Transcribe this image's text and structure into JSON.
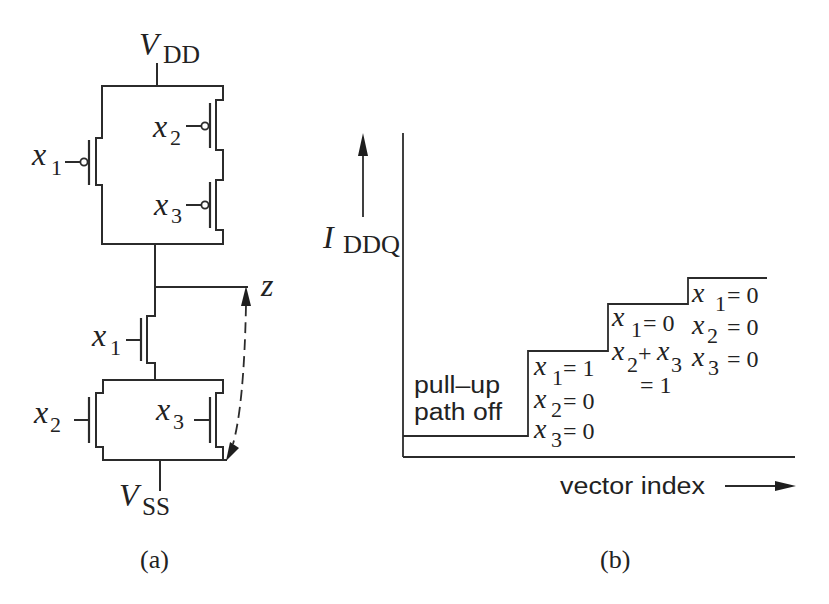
{
  "colors": {
    "background": "#ffffff",
    "line": "#2b2b2b",
    "text": "#222222"
  },
  "panel_a": {
    "caption": "(a)",
    "supply_top": {
      "symbol": "V",
      "subscript": "DD"
    },
    "supply_bottom": {
      "symbol": "V",
      "subscript": "SS"
    },
    "output_node": "z",
    "pull_up": [
      {
        "var": "x",
        "sub": "1"
      },
      {
        "var": "x",
        "sub": "2"
      },
      {
        "var": "x",
        "sub": "3"
      }
    ],
    "pull_down": [
      {
        "var": "x",
        "sub": "1"
      },
      {
        "var": "x",
        "sub": "2"
      },
      {
        "var": "x",
        "sub": "3"
      }
    ]
  },
  "panel_b": {
    "caption": "(b)",
    "y_axis": {
      "symbol": "I",
      "subscript": "DDQ"
    },
    "x_axis_label": "vector index",
    "steps": [
      {
        "lines": [
          "pull–up",
          "path off"
        ]
      },
      {
        "conditions": [
          {
            "var": "x",
            "sub": "1",
            "rest": "= 1"
          },
          {
            "var": "x",
            "sub": "2",
            "rest": "= 0"
          },
          {
            "var": "x",
            "sub": "3",
            "rest": "= 0"
          }
        ]
      },
      {
        "conditions": [
          {
            "var": "x",
            "sub": "1",
            "rest": "= 0"
          },
          {
            "var": "x",
            "sub": "2",
            "op": "+",
            "var2": "x",
            "sub2": "3"
          },
          {
            "rest": "= 1"
          }
        ]
      },
      {
        "conditions": [
          {
            "var": "x",
            "sub": "1",
            "rest": "= 0"
          },
          {
            "var": "x",
            "sub": "2",
            "rest": "= 0"
          },
          {
            "var": "x",
            "sub": "3",
            "rest": "= 0"
          }
        ]
      }
    ]
  }
}
